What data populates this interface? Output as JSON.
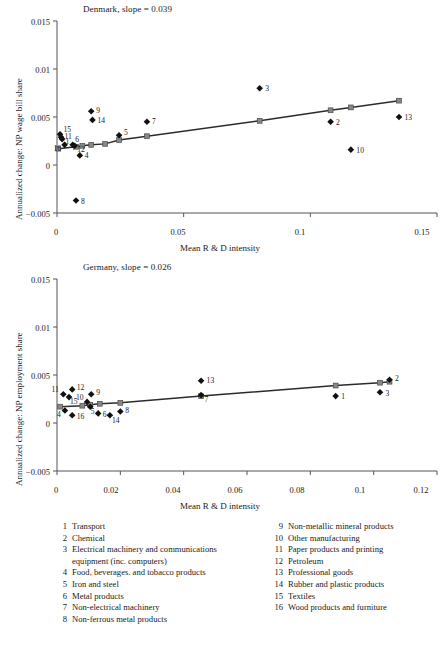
{
  "figure": {
    "panels": [
      {
        "id": "denmark",
        "title": "Denmark, slope = 0.039",
        "xlabel": "Mean R & D intensity",
        "ylabel": "Annualized change: NP wage bill share",
        "xticks": [
          "0",
          "0.05",
          "0.1",
          "0.15"
        ],
        "yticks": [
          "0.015",
          "0.01",
          "0.005",
          "0",
          "−0.005"
        ]
      },
      {
        "id": "germany",
        "title": "Germany, slope = 0.026",
        "xlabel": "Mean R & D intensity",
        "ylabel": "Annualized change: NP employment share",
        "xticks": [
          "0",
          "0.02",
          "0.04",
          "0.06",
          "0.08",
          "0.1",
          "0.12"
        ],
        "yticks": [
          "0.015",
          "0.01",
          "0.005",
          "0",
          "−0.005"
        ]
      }
    ]
  },
  "legend": {
    "left": [
      {
        "num": "1",
        "text": "Transport"
      },
      {
        "num": "2",
        "text": "Chemical"
      },
      {
        "num": "3",
        "text": "Electrical machinery and communications",
        "cont": "equipment (inc. computers)"
      },
      {
        "num": "4",
        "text": "Food, beverages. and tobacco products"
      },
      {
        "num": "5",
        "text": "Iron and steel"
      },
      {
        "num": "6",
        "text": "Metal products"
      },
      {
        "num": "7",
        "text": "Non-electrical machinery"
      },
      {
        "num": "8",
        "text": "Non-ferrous metal products"
      }
    ],
    "right": [
      {
        "num": "9",
        "text": "Non-metallic mineral products"
      },
      {
        "num": "10",
        "text": "Other manufacturing"
      },
      {
        "num": "11",
        "text": "Paper products and printing"
      },
      {
        "num": "12",
        "text": "Petroleum"
      },
      {
        "num": "13",
        "text": "Professional goods"
      },
      {
        "num": "14",
        "text": "Rubber and plastic products"
      },
      {
        "num": "15",
        "text": "Textiles"
      },
      {
        "num": "16",
        "text": "Wood products and furniture"
      }
    ]
  },
  "colors": {
    "marker": "#111111",
    "fit_line": "#2b2b2b",
    "fit_node": "#888888",
    "axis": "#555555",
    "text": "#1a1a1a"
  },
  "chart_data": [
    {
      "type": "scatter",
      "title": "Denmark, slope = 0.039",
      "xlabel": "Mean R & D intensity",
      "ylabel": "Annualized change: NP wage bill share",
      "xlim": [
        0,
        0.15
      ],
      "ylim": [
        -0.005,
        0.015
      ],
      "xticks": [
        0,
        0.05,
        0.1,
        0.15
      ],
      "yticks": [
        -0.005,
        0,
        0.005,
        0.01,
        0.015
      ],
      "grid": false,
      "legend": "none",
      "slope": 0.039,
      "points": [
        {
          "label": "15",
          "x": 0.0012,
          "y": 0.0032
        },
        {
          "label": "11",
          "x": 0.0016,
          "y": 0.0029
        },
        {
          "label": "1",
          "x": 0.002,
          "y": 0.0027
        },
        {
          "label": "16",
          "x": 0.003,
          "y": 0.0021
        },
        {
          "label": "6",
          "x": 0.0062,
          "y": 0.0021
        },
        {
          "label": "12",
          "x": 0.007,
          "y": 0.002
        },
        {
          "label": "4",
          "x": 0.009,
          "y": 0.001
        },
        {
          "label": "8",
          "x": 0.0075,
          "y": -0.0037
        },
        {
          "label": "9",
          "x": 0.0135,
          "y": 0.0056
        },
        {
          "label": "14",
          "x": 0.014,
          "y": 0.0047
        },
        {
          "label": "5",
          "x": 0.0245,
          "y": 0.0031
        },
        {
          "label": "7",
          "x": 0.0355,
          "y": 0.0045
        },
        {
          "label": "3",
          "x": 0.08,
          "y": 0.008
        },
        {
          "label": "2",
          "x": 0.108,
          "y": 0.0045
        },
        {
          "label": "10",
          "x": 0.116,
          "y": 0.0016
        },
        {
          "label": "13",
          "x": 0.135,
          "y": 0.005
        }
      ],
      "fit_line": {
        "name": "Fitted trend",
        "x": [
          0.0005,
          0.0075,
          0.01,
          0.0135,
          0.019,
          0.0245,
          0.0355,
          0.08,
          0.108,
          0.116,
          0.135
        ],
        "y": [
          0.0017,
          0.0019,
          0.002,
          0.0021,
          0.0022,
          0.0026,
          0.003,
          0.0046,
          0.0057,
          0.006,
          0.0067
        ]
      }
    },
    {
      "type": "scatter",
      "title": "Germany, slope = 0.026",
      "xlabel": "Mean R & D intensity",
      "ylabel": "Annualized change: NP employment share",
      "xlim": [
        0,
        0.12
      ],
      "ylim": [
        -0.005,
        0.015
      ],
      "xticks": [
        0,
        0.02,
        0.04,
        0.06,
        0.08,
        0.1,
        0.12
      ],
      "yticks": [
        -0.005,
        0,
        0.005,
        0.01,
        0.015
      ],
      "grid": false,
      "legend": "none",
      "slope": 0.026,
      "points": [
        {
          "label": "11",
          "x": 0.002,
          "y": 0.003
        },
        {
          "label": "12",
          "x": 0.0048,
          "y": 0.0035
        },
        {
          "label": "15",
          "x": 0.0038,
          "y": 0.0027
        },
        {
          "label": "4",
          "x": 0.0025,
          "y": 0.0013
        },
        {
          "label": "16",
          "x": 0.0048,
          "y": 0.0008
        },
        {
          "label": "10",
          "x": 0.0095,
          "y": 0.0022
        },
        {
          "label": "9",
          "x": 0.0108,
          "y": 0.003
        },
        {
          "label": "5",
          "x": 0.0105,
          "y": 0.0017
        },
        {
          "label": "6",
          "x": 0.013,
          "y": 0.001
        },
        {
          "label": "14",
          "x": 0.0167,
          "y": 0.0008
        },
        {
          "label": "8",
          "x": 0.02,
          "y": 0.0012
        },
        {
          "label": "13",
          "x": 0.0455,
          "y": 0.0044
        },
        {
          "label": "7",
          "x": 0.0455,
          "y": 0.0029
        },
        {
          "label": "1",
          "x": 0.088,
          "y": 0.0028
        },
        {
          "label": "3",
          "x": 0.102,
          "y": 0.0032
        },
        {
          "label": "2",
          "x": 0.105,
          "y": 0.0045
        }
      ],
      "fit_line": {
        "name": "Fitted trend",
        "x": [
          0.001,
          0.008,
          0.0105,
          0.0135,
          0.02,
          0.0455,
          0.088,
          0.102,
          0.105
        ],
        "y": [
          0.0017,
          0.0018,
          0.0019,
          0.002,
          0.0021,
          0.0028,
          0.0039,
          0.0042,
          0.0043
        ]
      }
    }
  ]
}
